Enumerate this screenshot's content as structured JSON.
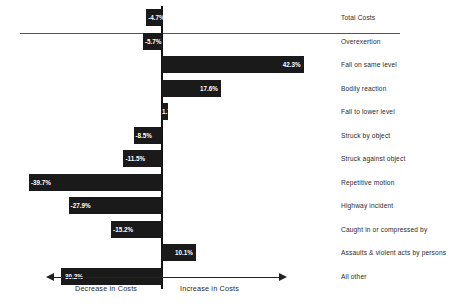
{
  "chart_data": {
    "type": "bar",
    "orientation": "horizontal",
    "title": "",
    "subtitle": "",
    "xlabel": "",
    "ylabel": "",
    "grid": false,
    "legend": null,
    "xlim": [
      -45,
      45
    ],
    "zero_axis": true,
    "categories": [
      "Total Costs",
      "Overexertion",
      "Fall on same level",
      "Bodily reaction",
      "Fall to lower level",
      "Struck by object",
      "Struck against object",
      "Repetitive motion",
      "Highway incident",
      "Caught in or compressed by",
      "Assaults & violent acts by persons",
      "All other"
    ],
    "values": [
      -4.7,
      -5.7,
      42.3,
      17.6,
      1.7,
      -8.5,
      -11.5,
      -39.7,
      -27.9,
      -15.2,
      10.1,
      -30.2
    ],
    "value_labels": [
      "-4.7%",
      "-5.7%",
      "42.3%",
      "17.6%",
      "1.7%",
      "-8.5%",
      "-11.5%",
      "-39.7%",
      "-27.9%",
      "-15.2%",
      "10.1%",
      "-30.2%"
    ],
    "bar_color": "#1a1a1a",
    "value_label_color": "#ffffff",
    "category_label_color": "#2b2b2b",
    "annotations": {
      "left_axis_caption": "Decrease in Costs",
      "right_axis_caption": "Increase in Costs"
    }
  },
  "axis": {
    "left_caption": "Decrease in Costs",
    "right_caption": "Increase in Costs"
  }
}
